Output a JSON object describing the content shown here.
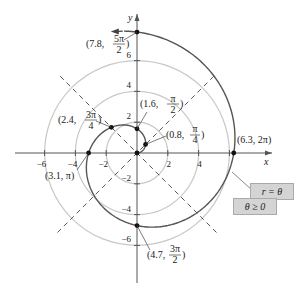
{
  "chart_data": {
    "type": "line",
    "subtype": "polar",
    "title": "",
    "equation": "r = θ",
    "domain": "θ ≥ 0",
    "xlabel": "x",
    "ylabel": "y",
    "xlim": [
      -7.5,
      7.5
    ],
    "ylim": [
      -7.5,
      7.5
    ],
    "x_ticks": [
      -6,
      -4,
      -2,
      2,
      4,
      6
    ],
    "y_ticks": [
      6,
      4,
      2,
      -2,
      -4,
      -6
    ],
    "x_tick_labels": [
      "−6",
      "−4",
      "−2",
      "2",
      "4"
    ],
    "y_tick_labels": [
      "6",
      "4",
      "2",
      "−2",
      "−4",
      "−6"
    ],
    "grid": "polar circles at r = 2, 4, 6 and dashed radial lines at θ = π/4, 3π/4",
    "series": [
      {
        "name": "r = θ",
        "theta_range": [
          0,
          7.85
        ],
        "color": "#555555"
      }
    ],
    "points": [
      {
        "r": 0.8,
        "theta": "π/4",
        "label": "(0.8, π/4)"
      },
      {
        "r": 1.6,
        "theta": "π/2",
        "label": "(1.6, π/2)"
      },
      {
        "r": 2.4,
        "theta": "3π/4",
        "label": "(2.4, 3π/4)"
      },
      {
        "r": 3.1,
        "theta": "π",
        "label": "(3.1, π)"
      },
      {
        "r": 4.7,
        "theta": "3π/2",
        "label": "(4.7, 3π/2)"
      },
      {
        "r": 6.3,
        "theta": "2π",
        "label": "(6.3, 2π)"
      },
      {
        "r": 7.8,
        "theta": "5π/2",
        "label": "(7.8, 5π/2)"
      }
    ],
    "legend": [
      "r = θ",
      "θ ≥ 0"
    ],
    "legend_position": "right-lower"
  },
  "labels": {
    "x_axis": "x",
    "y_axis": "y",
    "legend_eq": "r = θ",
    "legend_domain": "θ ≥ 0"
  }
}
